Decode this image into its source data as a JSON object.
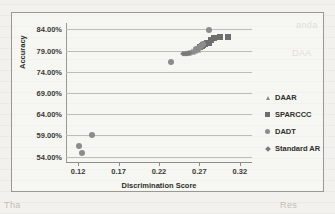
{
  "chart_data": {
    "type": "scatter",
    "title": "",
    "xlabel": "Discrimination Score",
    "ylabel": "Accuracy",
    "xlim": [
      0.105,
      0.335
    ],
    "ylim": [
      0.525,
      0.855
    ],
    "xticks": [
      "0.12",
      "0.17",
      "0.22",
      "0.27",
      "0.32"
    ],
    "xtick_values": [
      0.12,
      0.17,
      0.22,
      0.27,
      0.32
    ],
    "yticks": [
      "54.00%",
      "59.00%",
      "64.00%",
      "69.00%",
      "74.00%",
      "79.00%",
      "84.00%"
    ],
    "ytick_values": [
      0.54,
      0.59,
      0.64,
      0.69,
      0.74,
      0.79,
      0.84
    ],
    "grid": "horizontal",
    "legend_position": "right",
    "series": [
      {
        "name": "DAAR",
        "marker": "triangle",
        "color": "#8a8a8a",
        "points": [
          {
            "x": 0.2535,
            "y": 0.7835
          },
          {
            "x": 0.2555,
            "y": 0.7845
          },
          {
            "x": 0.2575,
            "y": 0.784
          },
          {
            "x": 0.2595,
            "y": 0.7855
          },
          {
            "x": 0.261,
            "y": 0.788
          },
          {
            "x": 0.2625,
            "y": 0.787
          },
          {
            "x": 0.264,
            "y": 0.7895
          },
          {
            "x": 0.266,
            "y": 0.7905
          },
          {
            "x": 0.268,
            "y": 0.792
          }
        ]
      },
      {
        "name": "SPARCCC",
        "marker": "square",
        "color": "#6e6e6e",
        "points": [
          {
            "x": 0.2705,
            "y": 0.7985
          },
          {
            "x": 0.273,
            "y": 0.801
          },
          {
            "x": 0.275,
            "y": 0.8035
          },
          {
            "x": 0.277,
            "y": 0.8055
          },
          {
            "x": 0.279,
            "y": 0.8075
          },
          {
            "x": 0.2815,
            "y": 0.809
          },
          {
            "x": 0.284,
            "y": 0.816
          },
          {
            "x": 0.2875,
            "y": 0.819
          },
          {
            "x": 0.295,
            "y": 0.8225
          },
          {
            "x": 0.3055,
            "y": 0.823
          }
        ]
      },
      {
        "name": "DADT",
        "marker": "circle",
        "color": "#8c8c8c",
        "points": [
          {
            "x": 0.1205,
            "y": 0.565
          },
          {
            "x": 0.1245,
            "y": 0.5475
          },
          {
            "x": 0.137,
            "y": 0.59
          },
          {
            "x": 0.235,
            "y": 0.763
          },
          {
            "x": 0.2655,
            "y": 0.7935
          },
          {
            "x": 0.269,
            "y": 0.796
          },
          {
            "x": 0.2715,
            "y": 0.801
          },
          {
            "x": 0.274,
            "y": 0.8055
          },
          {
            "x": 0.2815,
            "y": 0.839
          }
        ]
      },
      {
        "name": "Standard AR",
        "marker": "diamond",
        "color": "#7a7a7a",
        "points": [
          {
            "x": 0.25,
            "y": 0.782
          },
          {
            "x": 0.252,
            "y": 0.783
          },
          {
            "x": 0.2545,
            "y": 0.7825
          },
          {
            "x": 0.2565,
            "y": 0.785
          }
        ]
      }
    ]
  },
  "legend": {
    "items": [
      {
        "label": "DAAR",
        "marker": "triangle",
        "color": "#8a8a8a"
      },
      {
        "label": "SPARCCC",
        "marker": "square",
        "color": "#6e6e6e"
      },
      {
        "label": "DADT",
        "marker": "circle",
        "color": "#8c8c8c"
      },
      {
        "label": "Standard AR",
        "marker": "diamond",
        "color": "#7a7a7a"
      }
    ]
  },
  "background_text": {
    "lines": [
      "anda",
      "DAA",
      "Tha",
      "Res"
    ]
  }
}
